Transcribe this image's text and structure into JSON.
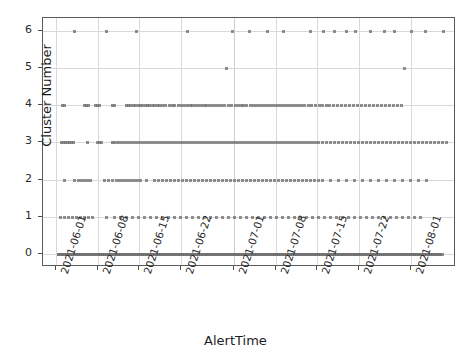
{
  "chart_data": {
    "type": "scatter",
    "title": "",
    "xlabel": "AlertTime",
    "ylabel": "Cluster Number",
    "grid": true,
    "legend": null,
    "ylim": [
      -0.35,
      6.35
    ],
    "yticks": [
      0,
      1,
      2,
      3,
      4,
      5,
      6
    ],
    "ytick_labels": [
      "0",
      "1",
      "2",
      "3",
      "4",
      "5",
      "6"
    ],
    "xlim": [
      "2021-05-29",
      "2021-08-05"
    ],
    "xticks": [
      "2021-06-01",
      "2021-06-08",
      "2021-06-15",
      "2021-06-22",
      "2021-07-01",
      "2021-07-08",
      "2021-07-15",
      "2021-07-22",
      "2021-08-01"
    ],
    "xtick_labels": [
      "2021-06-01",
      "2021-06-08",
      "2021-06-15",
      "2021-06-22",
      "2021-07-01",
      "2021-07-08",
      "2021-07-15",
      "2021-07-22",
      "2021-08-01"
    ],
    "marker": "square",
    "marker_color": "#6b6b6b",
    "marker_size": 3,
    "marker_opacity": 0.75,
    "series": [
      {
        "name": "Cluster 6",
        "y": 6,
        "x_pixels": [
          72,
          104,
          134,
          185,
          230,
          247,
          265,
          281,
          308,
          321,
          332,
          344,
          353,
          368,
          382,
          392,
          409,
          423,
          441
        ],
        "count": 19
      },
      {
        "name": "Cluster 5",
        "y": 5,
        "x_pixels": [
          224,
          402
        ],
        "count": 2
      },
      {
        "name": "Cluster 4",
        "y": 4,
        "x_pixels": [
          60,
          62,
          82,
          84,
          86,
          93,
          95,
          97,
          110,
          112,
          124,
          126,
          128,
          131,
          133,
          136,
          138,
          140,
          143,
          145,
          147,
          150,
          152,
          155,
          157,
          160,
          163,
          167,
          170,
          172,
          176,
          179,
          182,
          185,
          188,
          190,
          193,
          196,
          199,
          202,
          204,
          207,
          210,
          213,
          216,
          219,
          222,
          226,
          229,
          233,
          236,
          239,
          241,
          244,
          248,
          251,
          254,
          257,
          260,
          263,
          266,
          269,
          272,
          275,
          278,
          281,
          284,
          287,
          290,
          293,
          296,
          299,
          302,
          306,
          309,
          313,
          317,
          320,
          324,
          327,
          331,
          335,
          339,
          343,
          347,
          351,
          355,
          359,
          363,
          367,
          371,
          375,
          379,
          383,
          387,
          391,
          395,
          399
        ],
        "count": 98
      },
      {
        "name": "Cluster 3",
        "y": 3,
        "x_pixels": [
          59,
          61,
          63,
          65,
          67,
          69,
          71,
          85,
          95,
          97,
          99,
          110,
          112,
          115,
          118,
          121,
          124,
          127,
          130,
          133,
          136,
          139,
          142,
          145,
          148,
          151,
          154,
          157,
          160,
          163,
          166,
          169,
          172,
          175,
          178,
          181,
          184,
          187,
          190,
          193,
          196,
          199,
          202,
          205,
          208,
          211,
          214,
          217,
          220,
          223,
          226,
          229,
          232,
          235,
          238,
          241,
          244,
          247,
          250,
          253,
          256,
          259,
          262,
          265,
          268,
          271,
          274,
          277,
          280,
          283,
          286,
          289,
          292,
          295,
          298,
          301,
          304,
          307,
          310,
          313,
          316,
          320,
          324,
          328,
          332,
          336,
          340,
          344,
          348,
          352,
          356,
          360,
          364,
          368,
          372,
          376,
          380,
          384,
          388,
          392,
          396,
          400,
          404,
          408,
          412,
          416,
          420,
          424,
          428,
          432,
          436,
          440,
          444
        ],
        "count": 113
      },
      {
        "name": "Cluster 2",
        "y": 2,
        "x_pixels": [
          62,
          72,
          76,
          79,
          82,
          85,
          88,
          102,
          106,
          110,
          114,
          117,
          120,
          123,
          126,
          129,
          132,
          135,
          138,
          144,
          152,
          156,
          160,
          164,
          168,
          172,
          176,
          180,
          184,
          188,
          192,
          196,
          200,
          204,
          208,
          212,
          216,
          220,
          224,
          228,
          232,
          236,
          240,
          244,
          248,
          252,
          256,
          260,
          264,
          268,
          272,
          276,
          280,
          284,
          288,
          292,
          296,
          300,
          304,
          308,
          312,
          316,
          320,
          328,
          336,
          344,
          352,
          360,
          368,
          376,
          384,
          392,
          400,
          408,
          416,
          424
        ],
        "count": 76
      },
      {
        "name": "Cluster 1",
        "y": 1,
        "x_pixels": [
          58,
          62,
          66,
          70,
          74,
          78,
          82,
          86,
          90,
          104,
          112,
          118,
          124,
          130,
          136,
          142,
          148,
          154,
          160,
          166,
          172,
          178,
          184,
          190,
          196,
          202,
          208,
          214,
          220,
          226,
          232,
          238,
          244,
          250,
          256,
          262,
          268,
          274,
          280,
          286,
          292,
          298,
          304,
          310,
          316,
          322,
          328,
          334,
          340,
          346,
          352,
          358,
          364,
          370,
          376,
          382,
          388,
          394,
          400,
          406,
          412,
          418
        ],
        "count": 62
      },
      {
        "name": "Cluster 0",
        "y": 0,
        "x_pixels": [
          56,
          58,
          60,
          62,
          64,
          66,
          68,
          70,
          72,
          74,
          76,
          78,
          80,
          82,
          84,
          86,
          88,
          90,
          92,
          94,
          96,
          98,
          100,
          102,
          104,
          106,
          108,
          110,
          112,
          114,
          116,
          118,
          120,
          122,
          124,
          126,
          128,
          130,
          132,
          134,
          136,
          138,
          140,
          142,
          144,
          146,
          148,
          150,
          152,
          154,
          156,
          158,
          160,
          162,
          164,
          166,
          168,
          170,
          172,
          174,
          176,
          178,
          180,
          182,
          184,
          186,
          188,
          190,
          192,
          194,
          196,
          198,
          200,
          202,
          204,
          206,
          208,
          210,
          212,
          214,
          216,
          218,
          220,
          222,
          224,
          226,
          228,
          230,
          232,
          234,
          236,
          238,
          240,
          242,
          244,
          246,
          248,
          250,
          252,
          254,
          256,
          258,
          260,
          262,
          264,
          266,
          268,
          270,
          272,
          274,
          276,
          278,
          280,
          282,
          284,
          286,
          288,
          290,
          292,
          294,
          296,
          298,
          300,
          302,
          304,
          306,
          308,
          310,
          312,
          314,
          316,
          318,
          320,
          322,
          324,
          326,
          328,
          330,
          332,
          334,
          336,
          338,
          340,
          342,
          344,
          346,
          348,
          350,
          352,
          354,
          356,
          358,
          360,
          362,
          364,
          366,
          368,
          370,
          372,
          374,
          376,
          378,
          380,
          382,
          384,
          386,
          388,
          390,
          392,
          394,
          396,
          398,
          400,
          402,
          404,
          406,
          408,
          410,
          412,
          414,
          416,
          418,
          420,
          422,
          424,
          426,
          428,
          430,
          432,
          434,
          436,
          438,
          440
        ],
        "count": 193
      }
    ]
  }
}
